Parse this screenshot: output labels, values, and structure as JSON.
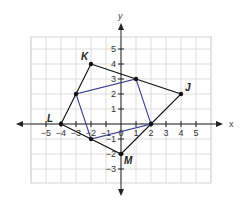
{
  "diagram": {
    "type": "coordinate-plane",
    "axes": {
      "x_label": "x",
      "y_label": "y"
    },
    "x_ticks": [
      "-5",
      "-4",
      "-3",
      "-2",
      "-1",
      "0",
      "1",
      "2",
      "3",
      "4",
      "5"
    ],
    "y_ticks": [
      "5",
      "4",
      "3",
      "2",
      "1",
      "-1",
      "-2",
      "-3"
    ],
    "outer_quadrilateral": {
      "color": "#111111",
      "vertices": [
        {
          "label": "K",
          "x": -2,
          "y": 4
        },
        {
          "label": "J",
          "x": 4,
          "y": 2
        },
        {
          "label": "M",
          "x": 0,
          "y": -2
        },
        {
          "label": "L",
          "x": -4,
          "y": 0
        }
      ]
    },
    "inner_quadrilateral": {
      "color": "#3a3f8f",
      "vertices": [
        {
          "x": 1,
          "y": 3
        },
        {
          "x": 2,
          "y": 0
        },
        {
          "x": -2,
          "y": -1
        },
        {
          "x": -3,
          "y": 2
        }
      ]
    },
    "vertex_labels": {
      "K": "K",
      "J": "J",
      "M": "M",
      "L": "L"
    }
  }
}
